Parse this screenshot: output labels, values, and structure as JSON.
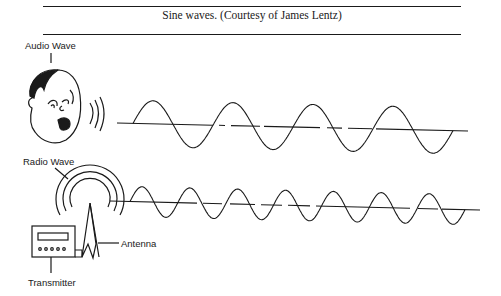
{
  "caption": "Sine waves. (Courtesy of James Lentz)",
  "labels": {
    "audio_wave": "Audio Wave",
    "radio_wave": "Radio Wave",
    "antenna": "Antenna",
    "transmitter": "Transmitter"
  },
  "figure": {
    "audio_wave": {
      "cycles": 4,
      "description": "lower-frequency sine wave emitted from a speaking face"
    },
    "radio_wave": {
      "cycles": 7,
      "description": "higher-frequency sine wave emitted from an antenna"
    }
  }
}
